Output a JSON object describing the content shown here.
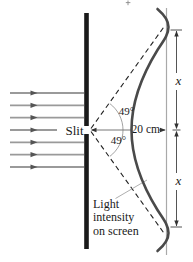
{
  "figure": {
    "labels": {
      "slit": "Slit",
      "distance": "20 cm",
      "angle_upper": "49°",
      "angle_lower": "49°",
      "x_upper": "x",
      "x_lower": "x",
      "intensity_line1": "Light",
      "intensity_line2": "intensity",
      "intensity_line3": "on screen"
    },
    "values": {
      "slit_to_screen_distance": "20 cm",
      "diffraction_angle_deg": "49",
      "fringe_offset_symbol": "x"
    },
    "colors": {
      "barrier": "#1a1a1a",
      "curve": "#4a4a4a",
      "ray": "#9a9a9a",
      "ray_arrow": "#555555",
      "screen_line": "#a9a9a9",
      "dashed_ray": "#222222",
      "dimension": "#333333",
      "arc": "#999999",
      "text": "#1a1a1a"
    }
  }
}
